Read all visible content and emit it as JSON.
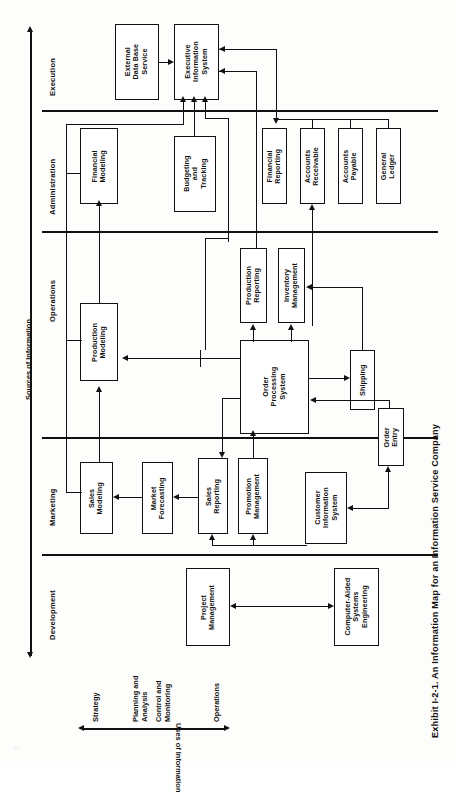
{
  "figure": {
    "caption": "Exhibit I-2-1. An Information Map for an Information Service Company",
    "corner_mark": "::"
  },
  "axes": {
    "vertical": {
      "title": "Sources of Information",
      "direction": "double-arrow-vertical"
    },
    "horizontal": {
      "title": "Uses of Information",
      "direction": "double-arrow-horizontal",
      "ticks": [
        "Strategy",
        "Planning and\nAnalysis",
        "Control and\nMonitoring",
        "Operations"
      ],
      "tick_lines": [
        {
          "label": "Strategy"
        },
        {
          "label_line1": "Planning and",
          "label_line2": "Analysis"
        },
        {
          "label_line1": "Control and",
          "label_line2": "Monitoring"
        },
        {
          "label": "Operations"
        }
      ]
    }
  },
  "bands": [
    {
      "id": "execution",
      "label": "Execution"
    },
    {
      "id": "administration",
      "label": "Administration"
    },
    {
      "id": "operations",
      "label": "Operations"
    },
    {
      "id": "marketing",
      "label": "Marketing"
    },
    {
      "id": "development",
      "label": "Development"
    }
  ],
  "nodes": [
    {
      "id": "external-data-base-service",
      "band": "execution",
      "label": "External\nData Base\nService",
      "l1": "External",
      "l2": "Data Base",
      "l3": "Service"
    },
    {
      "id": "executive-information-system",
      "band": "execution",
      "label": "Executive\nInformation\nSystem",
      "l1": "Executive",
      "l2": "Information",
      "l3": "System"
    },
    {
      "id": "financial-modeling",
      "band": "administration",
      "label": "Financial\nModeling",
      "l1": "Financial",
      "l2": "Modeling",
      "l3": ""
    },
    {
      "id": "budgeting-and-tracking",
      "band": "administration",
      "label": "Budgeting\nand\nTracking",
      "l1": "Budgeting",
      "l2": "and",
      "l3": "Tracking"
    },
    {
      "id": "financial-reporting",
      "band": "administration",
      "label": "Financial\nReporting",
      "l1": "Financial",
      "l2": "Reporting",
      "l3": ""
    },
    {
      "id": "accounts-receivable",
      "band": "administration",
      "label": "Accounts\nReceivable",
      "l1": "Accounts",
      "l2": "Receivable",
      "l3": ""
    },
    {
      "id": "accounts-payable",
      "band": "administration",
      "label": "Accounts\nPayable",
      "l1": "Accounts",
      "l2": "Payable",
      "l3": ""
    },
    {
      "id": "general-ledger",
      "band": "administration",
      "label": "General\nLedger",
      "l1": "General",
      "l2": "Ledger",
      "l3": ""
    },
    {
      "id": "production-modeling",
      "band": "operations",
      "label": "Production\nModeling",
      "l1": "Production",
      "l2": "Modeling",
      "l3": ""
    },
    {
      "id": "production-reporting",
      "band": "operations",
      "label": "Production\nReporting",
      "l1": "Production",
      "l2": "Reporting",
      "l3": ""
    },
    {
      "id": "inventory-management",
      "band": "operations",
      "label": "Inventory\nManagement",
      "l1": "Inventory",
      "l2": "Management",
      "l3": ""
    },
    {
      "id": "order-processing-system",
      "band": "operations",
      "label": "Order\nProcessing\nSystem",
      "l1": "Order",
      "l2": "Processing",
      "l3": "System"
    },
    {
      "id": "shipping",
      "band": "operations",
      "label": "Shipping",
      "l1": "Shipping",
      "l2": "",
      "l3": ""
    },
    {
      "id": "sales-modeling",
      "band": "marketing",
      "label": "Sales\nModeling",
      "l1": "Sales",
      "l2": "Modeling",
      "l3": ""
    },
    {
      "id": "market-forecasting",
      "band": "marketing",
      "label": "Market\nForecasting",
      "l1": "Market",
      "l2": "Forecasting",
      "l3": ""
    },
    {
      "id": "sales-reporting",
      "band": "marketing",
      "label": "Sales\nReporting",
      "l1": "Sales",
      "l2": "Reporting",
      "l3": ""
    },
    {
      "id": "promotion-management",
      "band": "marketing",
      "label": "Promotion\nManagement",
      "l1": "Promotion",
      "l2": "Management",
      "l3": ""
    },
    {
      "id": "customer-information-system",
      "band": "marketing",
      "label": "Customer\nInformation\nSystem",
      "l1": "Customer",
      "l2": "Information",
      "l3": "System"
    },
    {
      "id": "order-entry",
      "band": "marketing",
      "label": "Order\nEntry",
      "l1": "Order",
      "l2": "Entry",
      "l3": ""
    },
    {
      "id": "project-management",
      "band": "development",
      "label": "Project\nManagement",
      "l1": "Project",
      "l2": "Management",
      "l3": ""
    },
    {
      "id": "computer-aided-systems-engineering",
      "band": "development",
      "label": "Computer-Aided\nSystems\nEngineering",
      "l1": "Computer-Aided",
      "l2": "Systems",
      "l3": "Engineering"
    }
  ],
  "edges": [
    {
      "from": "external-data-base-service",
      "to": "executive-information-system"
    },
    {
      "from": "financial-modeling",
      "to": "executive-information-system"
    },
    {
      "from": "budgeting-and-tracking",
      "to": "executive-information-system"
    },
    {
      "from": "financial-reporting",
      "to": "executive-information-system"
    },
    {
      "from": "production-reporting",
      "to": "executive-information-system"
    },
    {
      "from": "sales-reporting",
      "to": "executive-information-system"
    },
    {
      "from": "general-ledger",
      "to": "financial-reporting"
    },
    {
      "from": "accounts-receivable",
      "to": "financial-reporting"
    },
    {
      "from": "accounts-payable",
      "to": "financial-reporting"
    },
    {
      "from": "order-processing-system",
      "to": "accounts-receivable"
    },
    {
      "from": "production-modeling",
      "to": "financial-modeling"
    },
    {
      "from": "sales-modeling",
      "to": "production-modeling"
    },
    {
      "from": "order-processing-system",
      "to": "production-modeling"
    },
    {
      "from": "order-processing-system",
      "to": "production-reporting"
    },
    {
      "from": "order-processing-system",
      "to": "inventory-management"
    },
    {
      "from": "inventory-management",
      "to": "shipping"
    },
    {
      "from": "order-processing-system",
      "to": "shipping"
    },
    {
      "from": "order-entry",
      "to": "order-processing-system"
    },
    {
      "from": "market-forecasting",
      "to": "sales-modeling"
    },
    {
      "from": "sales-reporting",
      "to": "market-forecasting"
    },
    {
      "from": "order-processing-system",
      "to": "sales-reporting"
    },
    {
      "from": "order-processing-system",
      "to": "promotion-management"
    },
    {
      "from": "customer-information-system",
      "to": "sales-reporting"
    },
    {
      "from": "customer-information-system",
      "to": "promotion-management"
    },
    {
      "from": "order-entry",
      "to": "customer-information-system"
    },
    {
      "from": "project-management",
      "to": "computer-aided-systems-engineering",
      "bidirectional": true
    }
  ],
  "colors": {
    "stroke": "#111111",
    "background": "#ffffff",
    "page": "#fdfdfb"
  }
}
